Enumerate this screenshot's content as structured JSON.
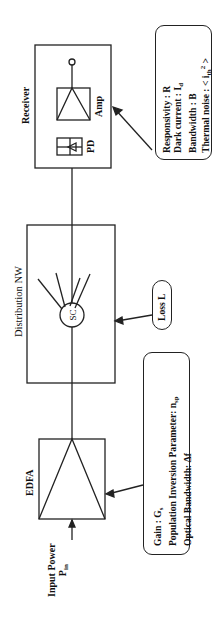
{
  "diagram": {
    "orientation": "rotated 90deg counter-clockwise",
    "blocks": {
      "edfa": {
        "title": "EDFA"
      },
      "distribution": {
        "title": "Distribution  NW",
        "splitter_label": "SC"
      },
      "receiver": {
        "title": "Receiver",
        "photodiode_label": "PD",
        "amplifier_label": "Amp"
      }
    },
    "input": {
      "line1": "Input Power",
      "line2_main": "P",
      "line2_sub": "in"
    },
    "edfa_params": {
      "gain_label": "Gain :  G",
      "gain_sub": "s",
      "inversion_label": "Population Inversion Parameter:  n",
      "inversion_sub": "sp",
      "bandwidth_label": "Optical Bandwidth:  Δf"
    },
    "loss_box": {
      "label": "Loss  L"
    },
    "receiver_params": {
      "responsivity": "Responsivity :  R",
      "dark_current_label": "Dark current : I",
      "dark_current_sub": "d",
      "bandwidth": "Bandwidth    :  B",
      "thermal_noise_label": "Thermal noise  : < i",
      "thermal_noise_sub": "th",
      "thermal_noise_sup": "2",
      "thermal_noise_end": " >"
    }
  }
}
